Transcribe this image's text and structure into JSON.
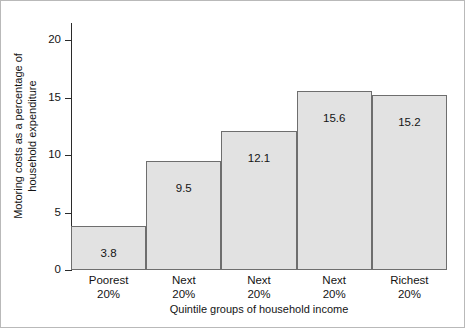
{
  "chart_data": {
    "type": "bar",
    "title": "",
    "xlabel": "Quintile groups of household income",
    "ylabel_line1": "Motoring costs as a percentage of",
    "ylabel_line2": "household expenditure",
    "categories": [
      "Poorest 20%",
      "Next 20%",
      "Next 20%",
      "Next 20%",
      "Richest 20%"
    ],
    "category_lines": [
      {
        "line1": "Poorest",
        "line2": "20%"
      },
      {
        "line1": "Next",
        "line2": "20%"
      },
      {
        "line1": "Next",
        "line2": "20%"
      },
      {
        "line1": "Next",
        "line2": "20%"
      },
      {
        "line1": "Richest",
        "line2": "20%"
      }
    ],
    "values": [
      3.8,
      9.5,
      12.1,
      15.6,
      15.2
    ],
    "value_labels": [
      "3.8",
      "9.5",
      "12.1",
      "15.6",
      "15.2"
    ],
    "ylim": [
      0,
      21.5
    ],
    "yticks": [
      0,
      5,
      10,
      15,
      20
    ],
    "ytick_labels": [
      "0",
      "5",
      "10",
      "15",
      "20"
    ],
    "grid": false,
    "legend": "none",
    "bar_fill_color": "#e2e2e2",
    "bar_edge_color": "#6e6e6e",
    "axis_color": "#2b2b2b",
    "text_color": "#141414",
    "background_color": "#ffffff"
  }
}
